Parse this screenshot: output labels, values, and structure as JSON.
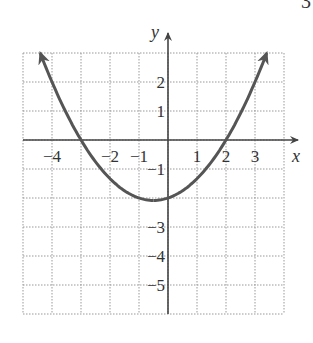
{
  "corner_mark": "3",
  "chart_data": {
    "type": "line",
    "title": "",
    "xlabel": "x",
    "ylabel": "y",
    "xlim": [
      -5,
      4
    ],
    "ylim": [
      -6,
      3
    ],
    "grid": true,
    "x_tick_labels": [
      "-4",
      "-2",
      "-1",
      "1",
      "2",
      "3"
    ],
    "y_tick_labels": [
      "2",
      "1",
      "-1",
      "-3",
      "-4",
      "-5"
    ],
    "series": [
      {
        "name": "parabola",
        "equation": "y = (x+3)(x-2)/3",
        "roots": [
          -3,
          2
        ],
        "y_intercept": -2,
        "vertex": [
          -0.5,
          -2.08
        ],
        "x": [
          -4.4,
          -4,
          -3,
          -2,
          -1,
          -0.5,
          0,
          1,
          2,
          3,
          3.4
        ],
        "values": [
          2.97,
          2.0,
          0,
          -1.33,
          -2.0,
          -2.08,
          -2.0,
          -1.33,
          0,
          2.0,
          2.97
        ],
        "arrows_both_ends": true,
        "color": "#555555"
      }
    ]
  }
}
